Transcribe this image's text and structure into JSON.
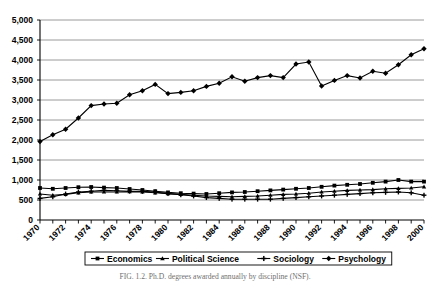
{
  "chart_data": {
    "type": "line",
    "title": "",
    "xlabel": "",
    "ylabel": "",
    "xlim": [
      1970,
      2000
    ],
    "ylim": [
      0,
      5000
    ],
    "grid": true,
    "legend_position": "bottom",
    "x": [
      1970,
      1971,
      1972,
      1973,
      1974,
      1975,
      1976,
      1977,
      1978,
      1979,
      1980,
      1981,
      1982,
      1983,
      1984,
      1985,
      1986,
      1987,
      1988,
      1989,
      1990,
      1991,
      1992,
      1993,
      1994,
      1995,
      1996,
      1997,
      1998,
      1999,
      2000
    ],
    "y_ticks": [
      "0",
      "500",
      "1,000",
      "1,500",
      "2,000",
      "2,500",
      "3,000",
      "3,500",
      "4,000",
      "4,500",
      "5,000"
    ],
    "y_tick_values": [
      0,
      500,
      1000,
      1500,
      2000,
      2500,
      3000,
      3500,
      4000,
      4500,
      5000
    ],
    "x_ticks": [
      "1970",
      "1972",
      "1974",
      "1976",
      "1978",
      "1980",
      "1982",
      "1984",
      "1986",
      "1988",
      "1990",
      "1992",
      "1994",
      "1996",
      "1998",
      "2000"
    ],
    "series": [
      {
        "name": "Economics",
        "marker": "square",
        "values": [
          800,
          780,
          800,
          820,
          825,
          810,
          800,
          775,
          750,
          720,
          690,
          670,
          660,
          650,
          670,
          690,
          700,
          720,
          740,
          760,
          780,
          800,
          830,
          860,
          880,
          900,
          930,
          960,
          1000,
          960,
          960
        ]
      },
      {
        "name": "Political Science",
        "marker": "triangle",
        "values": [
          650,
          620,
          640,
          680,
          700,
          700,
          700,
          710,
          700,
          680,
          660,
          640,
          620,
          600,
          590,
          580,
          590,
          600,
          620,
          640,
          650,
          670,
          700,
          720,
          740,
          750,
          760,
          780,
          790,
          800,
          830
        ]
      },
      {
        "name": "Sociology",
        "marker": "cross",
        "values": [
          540,
          580,
          650,
          700,
          720,
          740,
          730,
          720,
          715,
          700,
          660,
          630,
          600,
          560,
          540,
          520,
          520,
          520,
          520,
          540,
          560,
          580,
          600,
          620,
          640,
          660,
          680,
          690,
          700,
          680,
          620
        ]
      },
      {
        "name": "Psychology",
        "marker": "diamond",
        "values": [
          1960,
          2130,
          2270,
          2550,
          2860,
          2900,
          2920,
          3130,
          3230,
          3390,
          3160,
          3190,
          3230,
          3340,
          3420,
          3580,
          3470,
          3560,
          3610,
          3560,
          3900,
          3950,
          3350,
          3490,
          3610,
          3550,
          3720,
          3670,
          3880,
          4130,
          4280
        ]
      }
    ]
  },
  "legend": {
    "items": [
      {
        "label": "Economics",
        "marker": "square"
      },
      {
        "label": "Political Science",
        "marker": "triangle"
      },
      {
        "label": "Sociology",
        "marker": "cross"
      },
      {
        "label": "Psychology",
        "marker": "diamond"
      }
    ]
  },
  "caption": {
    "text": "FIG. 1.2.  Ph.D. degrees awarded annually by discipline (NSF)."
  }
}
